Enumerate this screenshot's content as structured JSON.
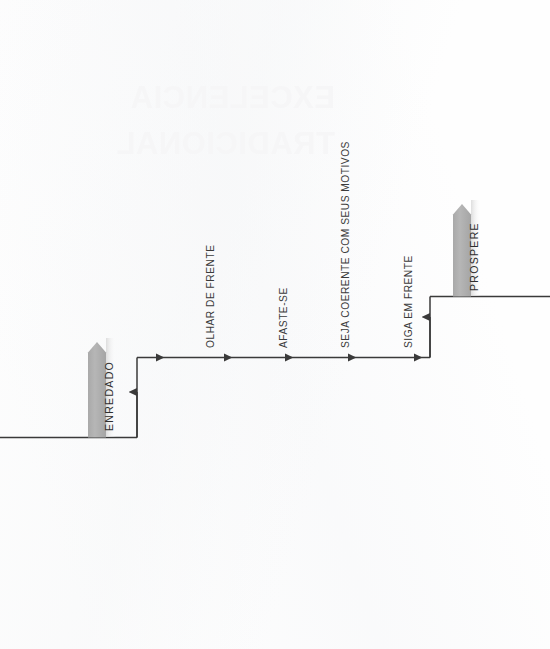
{
  "page": {
    "width": 550,
    "height": 649,
    "background_color": "#fefefe",
    "orientation_note": "diagram rotated 90 degrees (text reads bottom-to-top)"
  },
  "showthrough_watermark": {
    "visible": true,
    "mirrored": true,
    "line1": "EXCELENCIA",
    "line2": "TRADICIONAL",
    "color": "#f6f6f7"
  },
  "diagram": {
    "type": "staircase-flow",
    "line_color": "#3a3a3a",
    "banner_fill": "#b3b3b3",
    "banner_shadow": "#e6e6e6",
    "arrow_count": 7,
    "banners": [
      {
        "id": "start-banner",
        "label": "ENREDADO",
        "position": "lower-left",
        "x": 88,
        "y": 338,
        "height": 100
      },
      {
        "id": "end-banner",
        "label": "PROSPERE",
        "position": "upper-right",
        "x": 453,
        "y": 200,
        "height": 98
      }
    ],
    "steps": [
      {
        "index": 1,
        "label": "OLHAR DE FRENTE"
      },
      {
        "index": 2,
        "label": "AFASTE-SE"
      },
      {
        "index": 3,
        "label": "SEJA COERENTE COM SEUS MOTIVOS"
      },
      {
        "index": 4,
        "label": "SIGA EM FRENTE"
      }
    ]
  }
}
